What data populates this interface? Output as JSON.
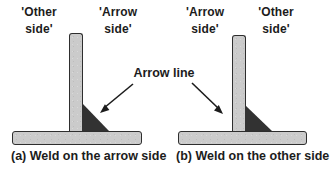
{
  "diagram_a": {
    "label_left_line1": "'Other",
    "label_left_line2": "side'",
    "label_right_line1": "'Arrow",
    "label_right_line2": "side'",
    "caption": "(a) Weld on the arrow side"
  },
  "diagram_b": {
    "label_left_line1": "'Arrow",
    "label_left_line2": "side'",
    "label_right_line1": "'Other",
    "label_right_line2": "side'",
    "caption": "(b) Weld on the other side"
  },
  "annotation": {
    "arrow_line_label": "Arrow line"
  },
  "colors": {
    "background": "#ffffff",
    "plate_fill": "#cbcbcb",
    "plate_border": "#2e2e2e",
    "weld_fill": "#323232",
    "text": "#1c1c1c"
  }
}
